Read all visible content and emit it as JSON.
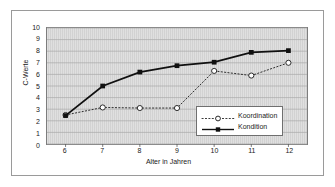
{
  "chart_data": {
    "type": "line",
    "title": "",
    "xlabel": "Alter in Jahren",
    "ylabel": "C-Werte",
    "x": [
      6,
      7,
      8,
      9,
      10,
      11,
      12
    ],
    "xtick_labels": [
      "6",
      "7",
      "8",
      "9",
      "10",
      "11",
      "12"
    ],
    "ytick_labels": [
      "10",
      "9",
      "8",
      "7",
      "6",
      "5",
      "4",
      "3",
      "2",
      "1",
      "0"
    ],
    "xlim": [
      5.5,
      12.5
    ],
    "ylim": [
      0,
      10
    ],
    "grid": "horizontal",
    "legend_position": "inside-bottom-right",
    "plot_background": "#d2d2d2",
    "series": [
      {
        "name": "Koordination",
        "values": [
          2.5,
          3.15,
          3.1,
          3.1,
          6.3,
          5.9,
          7.0
        ],
        "line_style": "dotted",
        "marker": "open-circle",
        "color": "#2a2a2a"
      },
      {
        "name": "Kondition",
        "values": [
          2.45,
          5.0,
          6.2,
          6.75,
          7.05,
          7.9,
          8.05
        ],
        "line_style": "solid",
        "marker": "filled-square",
        "color": "#101010"
      }
    ]
  },
  "legend": {
    "items": [
      {
        "label": "Koordination"
      },
      {
        "label": "Kondition"
      }
    ]
  }
}
